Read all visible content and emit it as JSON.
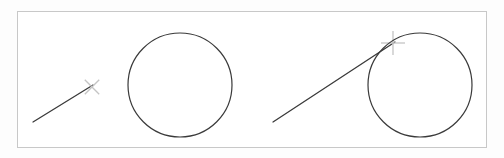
{
  "figure": {
    "canvas": {
      "width": 504,
      "height": 158,
      "background": "#fdfdfd"
    },
    "frame": {
      "name": "drawing-frame-border",
      "x": 17.5,
      "y": 11.5,
      "width": 469,
      "height": 136,
      "stroke": "#c8c8c8",
      "stroke_width": 1,
      "fill": "#ffffff"
    },
    "stroke_colors": {
      "geometry": "#3a3a3a",
      "marker": "#c4c4c4",
      "frame": "#c8c8c8"
    },
    "panels": [
      {
        "id": "left-panel",
        "label": "Panel A — line not touching circle",
        "line": {
          "name": "secant-line-left",
          "x1": 33,
          "y1": 122,
          "x2": 93,
          "y2": 85,
          "stroke": "#3a3a3a",
          "stroke_width": 1.3
        },
        "marker": {
          "name": "x-cross-marker",
          "glyph": "x-mark",
          "cx": 92,
          "cy": 87,
          "arm": 10,
          "stroke": "#c4c4c4",
          "stroke_width": 1.3
        },
        "circle": {
          "name": "circle-left",
          "cx": 180,
          "cy": 85,
          "r": 52,
          "stroke": "#3a3a3a",
          "stroke_width": 1.2,
          "fill": "none"
        }
      },
      {
        "id": "right-panel",
        "label": "Panel B — line tangent to circle",
        "line": {
          "name": "tangent-line-right",
          "x1": 273,
          "y1": 122,
          "x2": 395,
          "y2": 42,
          "stroke": "#3a3a3a",
          "stroke_width": 1.3
        },
        "marker": {
          "name": "plus-crosshair-marker",
          "glyph": "plus-mark",
          "cx": 393,
          "cy": 43,
          "arm": 12,
          "stroke": "#c4c4c4",
          "stroke_width": 1.3
        },
        "circle": {
          "name": "circle-right",
          "cx": 420,
          "cy": 85,
          "r": 52,
          "stroke": "#3a3a3a",
          "stroke_width": 1.2,
          "fill": "none"
        }
      }
    ]
  }
}
